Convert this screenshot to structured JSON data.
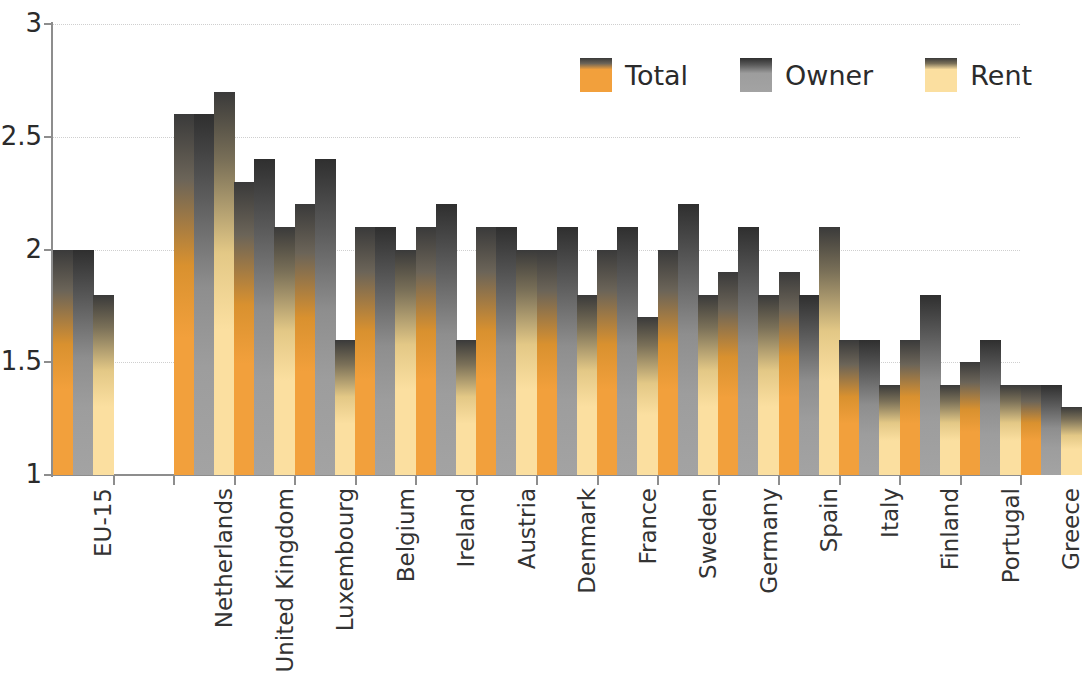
{
  "chart_data": {
    "type": "bar",
    "title": "",
    "subtitle": "",
    "xlabel": "",
    "ylabel": "",
    "ylim": [
      1,
      3
    ],
    "yticks": [
      "1",
      "1.5",
      "2",
      "2.5",
      "3"
    ],
    "ytick_values": [
      1,
      1.5,
      2,
      2.5,
      3
    ],
    "grid": true,
    "legend_position": "top-right",
    "categories": [
      "EU-15",
      "",
      "Netherlands",
      "United Kingdom",
      "Luxembourg",
      "Belgium",
      "Ireland",
      "Austria",
      "Denmark",
      "France",
      "Sweden",
      "Germany",
      "Spain",
      "Italy",
      "Finland",
      "Portugal",
      "Greece"
    ],
    "series": [
      {
        "name": "Total",
        "color": "#F2A03C",
        "values": [
          2.0,
          null,
          2.6,
          2.3,
          2.2,
          2.1,
          2.1,
          2.1,
          2.0,
          2.0,
          2.0,
          1.9,
          1.9,
          1.6,
          1.6,
          1.5,
          1.4
        ]
      },
      {
        "name": "Owner",
        "color": "#9D9D9D",
        "values": [
          2.0,
          null,
          2.6,
          2.4,
          2.4,
          2.1,
          2.2,
          2.1,
          2.1,
          2.1,
          2.2,
          2.1,
          1.8,
          1.6,
          1.8,
          1.6,
          1.4
        ]
      },
      {
        "name": "Rent",
        "color": "#FBDFA0",
        "values": [
          1.8,
          null,
          2.7,
          2.1,
          1.6,
          2.0,
          1.6,
          2.0,
          1.8,
          1.7,
          1.8,
          1.8,
          2.1,
          1.4,
          1.4,
          1.4,
          1.3
        ]
      }
    ]
  },
  "legend": {
    "items": [
      {
        "label": "Total",
        "color": "#F2A03C"
      },
      {
        "label": "Owner",
        "color": "#9D9D9D"
      },
      {
        "label": "Rent",
        "color": "#FBDFA0"
      }
    ]
  },
  "axis": {
    "y_labels": [
      "3",
      "2.5",
      "2",
      "1.5",
      "1"
    ]
  }
}
